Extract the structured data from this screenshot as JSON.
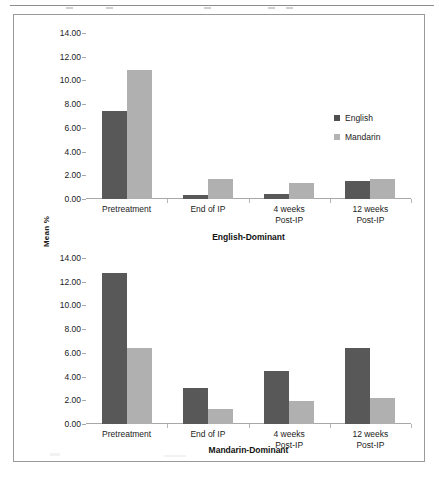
{
  "figure": {
    "y_axis_title": "Mean %",
    "legend": [
      {
        "label": "English",
        "color": "#585858",
        "icon": "square-swatch-icon"
      },
      {
        "label": "Mandarin",
        "color": "#b0b0b0",
        "icon": "square-swatch-icon"
      }
    ]
  },
  "chart_data": [
    {
      "type": "bar",
      "title": "English-Dominant",
      "xlabel": "",
      "ylabel": "Mean %",
      "ylim": [
        0,
        14
      ],
      "ytick_labels": [
        "14.00",
        "12.00",
        "10.00",
        "8.00",
        "6.00",
        "4.00",
        "2.00",
        "0.00"
      ],
      "ytick_values": [
        14,
        12,
        10,
        8,
        6,
        4,
        2,
        0
      ],
      "grid": false,
      "legend_position": "right",
      "categories": [
        "Pretreatment",
        "End of IP",
        "4 weeks Post-IP",
        "12 weeks Post-IP"
      ],
      "category_lines": [
        [
          "Pretreatment"
        ],
        [
          "End of IP"
        ],
        [
          "4 weeks",
          "Post-IP"
        ],
        [
          "12 weeks",
          "Post-IP"
        ]
      ],
      "series": [
        {
          "name": "English",
          "color": "#585858",
          "values": [
            7.4,
            0.3,
            0.45,
            1.5
          ]
        },
        {
          "name": "Mandarin",
          "color": "#b0b0b0",
          "values": [
            10.9,
            1.7,
            1.35,
            1.7
          ]
        }
      ]
    },
    {
      "type": "bar",
      "title": "Mandarin-Dominant",
      "xlabel": "",
      "ylabel": "Mean %",
      "ylim": [
        0,
        14
      ],
      "ytick_labels": [
        "14.00",
        "12.00",
        "10.00",
        "8.00",
        "6.00",
        "4.00",
        "2.00",
        "0.00"
      ],
      "ytick_values": [
        14,
        12,
        10,
        8,
        6,
        4,
        2,
        0
      ],
      "grid": false,
      "legend_position": "none",
      "categories": [
        "Pretreatment",
        "End of IP",
        "4 weeks Post-IP",
        "12 weeks Post-IP"
      ],
      "category_lines": [
        [
          "Pretreatment"
        ],
        [
          "End of IP"
        ],
        [
          "4 weeks",
          "Post-IP"
        ],
        [
          "12 weeks",
          "Post-IP"
        ]
      ],
      "series": [
        {
          "name": "English",
          "color": "#585858",
          "values": [
            12.75,
            3.0,
            4.5,
            6.45
          ]
        },
        {
          "name": "Mandarin",
          "color": "#b0b0b0",
          "values": [
            6.4,
            1.3,
            1.9,
            2.2
          ]
        }
      ]
    }
  ]
}
